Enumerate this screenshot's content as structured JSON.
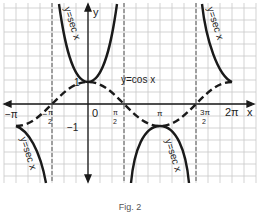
{
  "figure": {
    "caption": "Fig. 2",
    "axes": {
      "x_label": "x",
      "y_label": "y",
      "origin_label": "0",
      "y_tick_labels": [
        "1",
        "−1"
      ],
      "x_tick_labels": [
        "−π",
        "−π/2",
        "π/2",
        "π",
        "3π/2",
        "2π"
      ]
    },
    "curve_labels": {
      "cos": "y=cos x",
      "sec_1": "y=sec x",
      "sec_2": "y=sec x",
      "sec_3": "y=sec x",
      "sec_4": "y=sec x"
    },
    "ticks": {
      "neg_pi": "−π",
      "neg_half_pi_num": "π",
      "neg_half_pi_den": "2",
      "neg_sign": "−",
      "half_pi_num": "π",
      "half_pi_den": "2",
      "pi": "π",
      "three_half_pi_num": "3π",
      "three_half_pi_den": "2",
      "two_pi": "2π",
      "one": "1",
      "neg_one": "−1",
      "zero": "0"
    },
    "asymptotes": [
      "−π/2",
      "π/2",
      "3π/2"
    ],
    "colors": {
      "curve": "#1a1a1a",
      "grid": "#c8c8c8",
      "asymptote": "#555555"
    }
  }
}
